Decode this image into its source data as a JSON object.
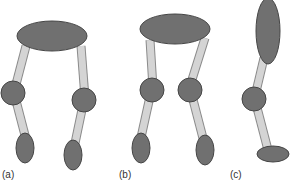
{
  "figure": {
    "panels": [
      {
        "id": "a",
        "label": "(a)",
        "label_pos": [
          2,
          169
        ]
      },
      {
        "id": "b",
        "label": "(b)",
        "label_pos": [
          119,
          169
        ]
      },
      {
        "id": "c",
        "label": "(c)",
        "label_pos": [
          230,
          169
        ]
      }
    ],
    "colors": {
      "joint_fill": "#707070",
      "joint_stroke": "#454545",
      "link_fill": "#d4d4d4",
      "link_stroke": "#8a8a8a"
    }
  }
}
